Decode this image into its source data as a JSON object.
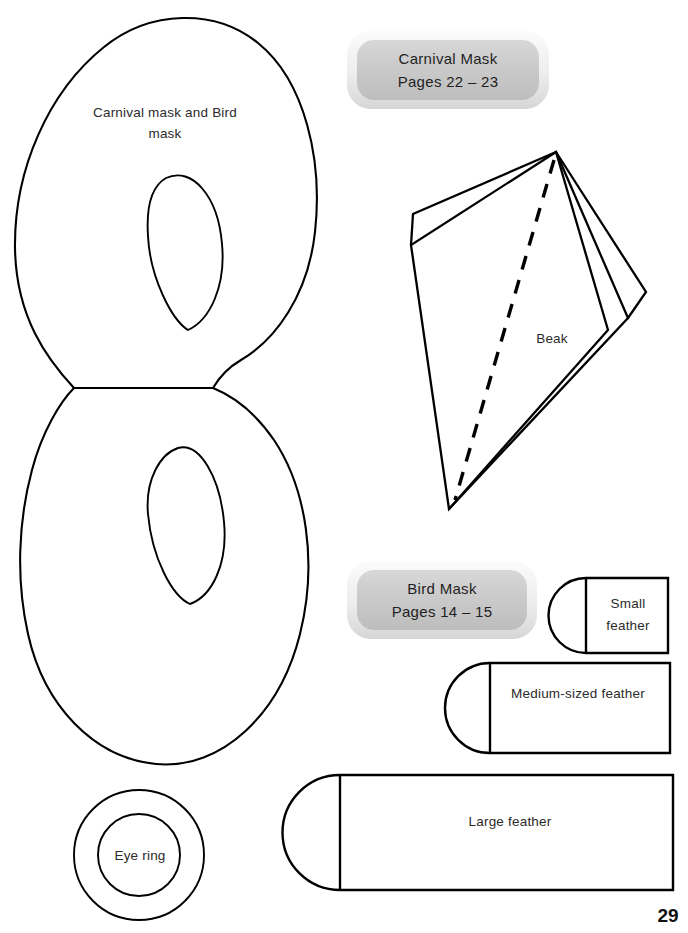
{
  "page": {
    "number": "29",
    "background_color": "#ffffff",
    "ink_color": "#000000"
  },
  "pieces": {
    "mask": {
      "label_line1": "Carnival mask and Bird",
      "label_line2": "mask",
      "name": "carnival-and-bird-mask"
    },
    "beak": {
      "label": "Beak",
      "name": "beak"
    },
    "eye_ring": {
      "label": "Eye ring",
      "name": "eye-ring"
    },
    "small_feather": {
      "label_line1": "Small",
      "label_line2": "feather",
      "name": "small-feather"
    },
    "medium_feather": {
      "label": "Medium-sized feather",
      "name": "medium-sized-feather"
    },
    "large_feather": {
      "label": "Large feather",
      "name": "large-feather"
    }
  },
  "tabs": [
    {
      "title": "Carnival Mask",
      "pages": "Pages 22 – 23",
      "fill_color": "#c9c9c9",
      "border_color": "#f2f2f2"
    },
    {
      "title": "Bird Mask",
      "pages": "Pages 14 – 15",
      "fill_color": "#c9c9c9",
      "border_color": "#f2f2f2"
    }
  ]
}
